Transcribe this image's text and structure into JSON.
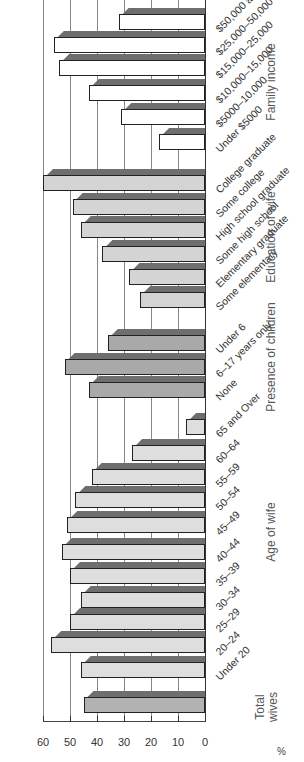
{
  "chart_data": {
    "type": "bar",
    "title": "",
    "ylabel": "%",
    "xlabel": "",
    "ylim": [
      0,
      60
    ],
    "yticks": [
      0,
      10,
      20,
      30,
      40,
      50,
      60
    ],
    "grid": true,
    "orientation_note": "image rotated 90 degrees",
    "groups": [
      {
        "name": "Total wives",
        "color": "#b2b2b2",
        "categories": [
          ""
        ],
        "values": [
          45
        ]
      },
      {
        "name": "Age of wife",
        "color": "#dedede",
        "categories": [
          "Under 20",
          "20–24",
          "25–29",
          "30–34",
          "35–39",
          "40–44",
          "45–49",
          "50–54",
          "55–59",
          "60–64",
          "65 and Over"
        ],
        "values": [
          46,
          57,
          50,
          46,
          50,
          53,
          51,
          48,
          42,
          27,
          7
        ]
      },
      {
        "name": "Presence of children",
        "color": "#a9a9a9",
        "categories": [
          "None",
          "6–17 years only",
          "Under 6"
        ],
        "values": [
          43,
          52,
          36
        ]
      },
      {
        "name": "Education of wife",
        "color": "#d4d4d4",
        "categories": [
          "Some elementary",
          "Elementary graduate",
          "Some high school",
          "High school graduate",
          "Some college",
          "College graduate"
        ],
        "values": [
          24,
          28,
          38,
          46,
          49,
          60
        ]
      },
      {
        "name": "Family income",
        "color": "#ffffff",
        "categories": [
          "Under $5000",
          "$5000–10,000",
          "$10,000–15,000",
          "$15,000–25,000",
          "$25,000–50,000",
          "$50,000 and Over"
        ],
        "values": [
          17,
          31,
          43,
          54,
          56,
          32
        ]
      }
    ]
  },
  "axis": {
    "unit_label": "%",
    "tick_labels": [
      "0",
      "10",
      "20",
      "30",
      "40",
      "50",
      "60"
    ]
  },
  "titles": {
    "total": "Total\nwives",
    "age": "Age of wife",
    "children": "Presence of children",
    "education": "Education of wife",
    "income": "Family income"
  }
}
